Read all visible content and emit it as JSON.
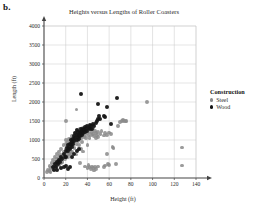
{
  "part_label": "b.",
  "legend": {
    "title": "Construction",
    "items": [
      {
        "label": "Steel",
        "color": "#8a8a8a"
      },
      {
        "label": "Wood",
        "color": "#151515"
      }
    ]
  },
  "chart_data": {
    "type": "scatter",
    "title": "Heights versus Lengths of Roller Coasters",
    "xlabel": "Height (ft)",
    "ylabel": "Length (ft)",
    "xlim": [
      0,
      140
    ],
    "ylim": [
      0,
      4000
    ],
    "xticks": [
      0,
      20,
      40,
      60,
      80,
      100,
      120,
      140
    ],
    "yticks": [
      0,
      500,
      1000,
      1500,
      2000,
      2500,
      3000,
      3500,
      4000
    ],
    "grid": true,
    "legend_position": "right",
    "series": [
      {
        "name": "Steel",
        "color": "#8a8a8a",
        "points": [
          [
            3,
            150
          ],
          [
            4,
            220
          ],
          [
            5,
            180
          ],
          [
            5,
            320
          ],
          [
            6,
            260
          ],
          [
            7,
            400
          ],
          [
            8,
            300
          ],
          [
            8,
            480
          ],
          [
            9,
            360
          ],
          [
            10,
            420
          ],
          [
            10,
            560
          ],
          [
            11,
            300
          ],
          [
            12,
            500
          ],
          [
            12,
            640
          ],
          [
            13,
            420
          ],
          [
            14,
            560
          ],
          [
            14,
            700
          ],
          [
            15,
            480
          ],
          [
            15,
            620
          ],
          [
            16,
            540
          ],
          [
            16,
            760
          ],
          [
            17,
            620
          ],
          [
            17,
            420
          ],
          [
            18,
            700
          ],
          [
            18,
            860
          ],
          [
            19,
            640
          ],
          [
            19,
            500
          ],
          [
            20,
            760
          ],
          [
            20,
            900
          ],
          [
            20,
            1500
          ],
          [
            21,
            680
          ],
          [
            21,
            820
          ],
          [
            22,
            760
          ],
          [
            22,
            940
          ],
          [
            22,
            560
          ],
          [
            23,
            840
          ],
          [
            23,
            1020
          ],
          [
            24,
            780
          ],
          [
            24,
            900
          ],
          [
            25,
            860
          ],
          [
            25,
            1040
          ],
          [
            25,
            660
          ],
          [
            26,
            940
          ],
          [
            26,
            1100
          ],
          [
            27,
            880
          ],
          [
            27,
            1020
          ],
          [
            28,
            960
          ],
          [
            28,
            1140
          ],
          [
            28,
            780
          ],
          [
            29,
            1020
          ],
          [
            29,
            1180
          ],
          [
            30,
            900
          ],
          [
            30,
            1080
          ],
          [
            30,
            1240
          ],
          [
            31,
            980
          ],
          [
            31,
            1140
          ],
          [
            32,
            1060
          ],
          [
            32,
            1220
          ],
          [
            32,
            860
          ],
          [
            33,
            1120
          ],
          [
            33,
            1280
          ],
          [
            34,
            1040
          ],
          [
            34,
            1180
          ],
          [
            35,
            1100
          ],
          [
            35,
            1260
          ],
          [
            35,
            940
          ],
          [
            36,
            1160
          ],
          [
            36,
            1320
          ],
          [
            37,
            1080
          ],
          [
            37,
            1220
          ],
          [
            38,
            1140
          ],
          [
            38,
            1300
          ],
          [
            39,
            1060
          ],
          [
            39,
            1240
          ],
          [
            40,
            1180
          ],
          [
            40,
            1340
          ],
          [
            40,
            860
          ],
          [
            41,
            1120
          ],
          [
            41,
            1280
          ],
          [
            42,
            1200
          ],
          [
            42,
            1060
          ],
          [
            43,
            1140
          ],
          [
            43,
            1320
          ],
          [
            44,
            1220
          ],
          [
            45,
            1160
          ],
          [
            45,
            1300
          ],
          [
            46,
            1100
          ],
          [
            47,
            1240
          ],
          [
            48,
            1180
          ],
          [
            48,
            1060
          ],
          [
            49,
            1140
          ],
          [
            50,
            1220
          ],
          [
            50,
            1080
          ],
          [
            52,
            1160
          ],
          [
            53,
            1240
          ],
          [
            55,
            1120
          ],
          [
            56,
            1180
          ],
          [
            58,
            1140
          ],
          [
            60,
            1200
          ],
          [
            62,
            1160
          ],
          [
            30,
            1800
          ],
          [
            33,
            400
          ],
          [
            38,
            300
          ],
          [
            40,
            260
          ],
          [
            41,
            340
          ],
          [
            42,
            280
          ],
          [
            43,
            240
          ],
          [
            44,
            300
          ],
          [
            45,
            260
          ],
          [
            46,
            200
          ],
          [
            47,
            280
          ],
          [
            48,
            240
          ],
          [
            50,
            300
          ],
          [
            55,
            280
          ],
          [
            56,
            330
          ],
          [
            58,
            640
          ],
          [
            59,
            360
          ],
          [
            60,
            340
          ],
          [
            66,
            360
          ],
          [
            70,
            1480
          ],
          [
            72,
            1500
          ],
          [
            73,
            1520
          ],
          [
            74,
            1500
          ],
          [
            75,
            1490
          ],
          [
            76,
            1510
          ],
          [
            68,
            1360
          ],
          [
            63,
            820
          ],
          [
            64,
            780
          ],
          [
            95,
            1990
          ],
          [
            127,
            800
          ],
          [
            127,
            330
          ],
          [
            20,
            1000
          ],
          [
            18,
            540
          ],
          [
            16,
            400
          ],
          [
            14,
            340
          ],
          [
            12,
            380
          ],
          [
            10,
            300
          ],
          [
            8,
            240
          ],
          [
            6,
            160
          ],
          [
            26,
            700
          ],
          [
            30,
            620
          ],
          [
            34,
            760
          ],
          [
            36,
            700
          ],
          [
            24,
            640
          ],
          [
            22,
            620
          ]
        ]
      },
      {
        "name": "Wood",
        "color": "#151515",
        "points": [
          [
            8,
            300
          ],
          [
            9,
            220
          ],
          [
            10,
            360
          ],
          [
            11,
            300
          ],
          [
            12,
            420
          ],
          [
            13,
            380
          ],
          [
            14,
            480
          ],
          [
            15,
            420
          ],
          [
            16,
            560
          ],
          [
            17,
            500
          ],
          [
            18,
            620
          ],
          [
            19,
            560
          ],
          [
            20,
            700
          ],
          [
            20,
            560
          ],
          [
            21,
            780
          ],
          [
            22,
            700
          ],
          [
            22,
            860
          ],
          [
            23,
            800
          ],
          [
            24,
            900
          ],
          [
            24,
            760
          ],
          [
            25,
            860
          ],
          [
            25,
            1000
          ],
          [
            26,
            940
          ],
          [
            26,
            820
          ],
          [
            27,
            1020
          ],
          [
            27,
            900
          ],
          [
            28,
            1100
          ],
          [
            28,
            980
          ],
          [
            29,
            1060
          ],
          [
            29,
            1180
          ],
          [
            30,
            1000
          ],
          [
            30,
            1140
          ],
          [
            30,
            1260
          ],
          [
            31,
            1080
          ],
          [
            31,
            1200
          ],
          [
            32,
            1140
          ],
          [
            32,
            1020
          ],
          [
            33,
            1220
          ],
          [
            33,
            1100
          ],
          [
            34,
            1180
          ],
          [
            34,
            1300
          ],
          [
            35,
            1240
          ],
          [
            35,
            1120
          ],
          [
            36,
            1300
          ],
          [
            36,
            1180
          ],
          [
            37,
            1260
          ],
          [
            38,
            1340
          ],
          [
            38,
            1200
          ],
          [
            39,
            1280
          ],
          [
            40,
            1360
          ],
          [
            40,
            1240
          ],
          [
            41,
            1320
          ],
          [
            42,
            1400
          ],
          [
            42,
            1280
          ],
          [
            43,
            1360
          ],
          [
            44,
            1300
          ],
          [
            45,
            1420
          ],
          [
            46,
            1380
          ],
          [
            48,
            1440
          ],
          [
            49,
            1500
          ],
          [
            50,
            1560
          ],
          [
            51,
            1620
          ],
          [
            52,
            1560
          ],
          [
            55,
            1640
          ],
          [
            56,
            1600
          ],
          [
            34,
            2220
          ],
          [
            50,
            1960
          ],
          [
            58,
            1880
          ],
          [
            67,
            2100
          ],
          [
            62,
            1420
          ],
          [
            20,
            320
          ],
          [
            18,
            280
          ],
          [
            22,
            240
          ],
          [
            24,
            300
          ],
          [
            12,
            200
          ],
          [
            28,
            640
          ],
          [
            30,
            700
          ],
          [
            32,
            760
          ],
          [
            26,
            560
          ],
          [
            16,
            260
          ]
        ]
      }
    ]
  }
}
